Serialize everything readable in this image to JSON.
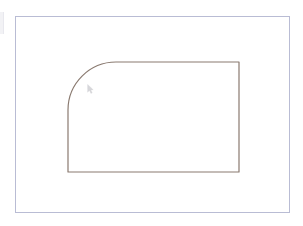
{
  "app": {
    "title": "CAD Drawing Canvas",
    "background_color": "#ffffff"
  },
  "page_border": {
    "name": "sheet-border",
    "color": "#b9bcd4",
    "stroke_width": 1,
    "x": 15,
    "y": 16,
    "width": 275,
    "height": 197
  },
  "edge_sliver": {
    "name": "viewport-edge-sliver",
    "color": "#e8e8ee"
  },
  "shape": {
    "name": "filleted-rectangle",
    "type": "rectangle-with-rounded-corner",
    "color": "#8a7a70",
    "stroke_width": 1.2,
    "left": 68,
    "top": 62,
    "right": 239,
    "bottom": 172,
    "fillet_corner": "top-left",
    "fillet_radius": 48,
    "arc_start": {
      "x": 68,
      "y": 110
    },
    "arc_end": {
      "x": 116,
      "y": 62
    }
  },
  "cursor": {
    "name": "drawing-cursor",
    "icon": "cursor-arrow-icon",
    "x": 90,
    "y": 88,
    "color": "#b7b7bd"
  }
}
